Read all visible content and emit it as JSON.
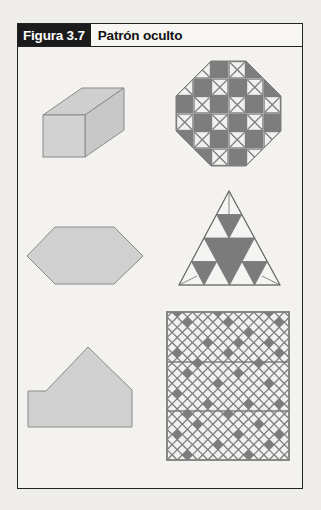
{
  "figure": {
    "label": "Figura 3.7",
    "title": "Patrón oculto"
  },
  "colors": {
    "shape_fill": "#cfcfcf",
    "shape_stroke": "#8a8a8a",
    "pattern_gray": "#7d7d7d",
    "pattern_light": "#f1f1ef",
    "frame": "#222222",
    "label_bg": "#1b1b1b"
  },
  "shapes": [
    {
      "name": "rectangular-prism",
      "description": "3D rectangular prism"
    },
    {
      "name": "octagon-pattern",
      "description": "Octagon on 6x6 grid, gray and X-marked cells"
    },
    {
      "name": "hexagon",
      "description": "Elongated hexagon"
    },
    {
      "name": "sierpinski-triangle",
      "description": "Triangle subdivided with gray inverted triangles"
    },
    {
      "name": "house-pentagon",
      "description": "Irregular pentagon"
    },
    {
      "name": "diamond-grid-square",
      "description": "Square lattice of diamonds with hidden gray pattern, 3 strips"
    }
  ]
}
